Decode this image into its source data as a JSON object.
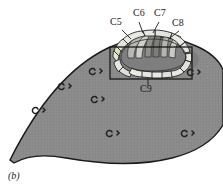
{
  "figure": {
    "panel_label": "(b)",
    "caption_tag": "b",
    "labels": {
      "c5": "C5",
      "c6": "C6",
      "c7": "C7",
      "c8": "C8",
      "c9": "C9"
    },
    "colors": {
      "body_fill": "#8a8a8a",
      "body_outline": "#1a1a1a",
      "segment_light": "#e9e9e4",
      "segment_mid": "#c9c9c4",
      "segment_dark": "#7d7d7d",
      "inner_shadow": "#9a9a9a",
      "box_stroke": "#1a1a1a",
      "leader_stroke": "#1a1a1a",
      "text": "#1a1a1a",
      "background": "#ffffff"
    },
    "label_positions": {
      "c5": {
        "x": 112,
        "y": 22
      },
      "c6": {
        "x": 134,
        "y": 13
      },
      "c7": {
        "x": 155,
        "y": 13
      },
      "c8": {
        "x": 173,
        "y": 23
      },
      "c9": {
        "x": 141,
        "y": 85
      }
    },
    "structure": {
      "name": "horseshoe-shaped segmented ring",
      "segment_count_outer": 16,
      "segment_count_inner": 6,
      "description": "U-shaped ring of pale lobules surrounding a darker central cleft, enclosed by a rectangular callout box"
    },
    "scattered_marks": {
      "name": "small c-shaped surface marks",
      "count": 8,
      "positions": [
        {
          "x": 98,
          "y": 71
        },
        {
          "x": 67,
          "y": 86
        },
        {
          "x": 100,
          "y": 99
        },
        {
          "x": 41,
          "y": 110
        },
        {
          "x": 115,
          "y": 133
        },
        {
          "x": 190,
          "y": 133
        },
        {
          "x": 194,
          "y": 72
        },
        {
          "x": 150,
          "y": 118
        }
      ]
    }
  }
}
